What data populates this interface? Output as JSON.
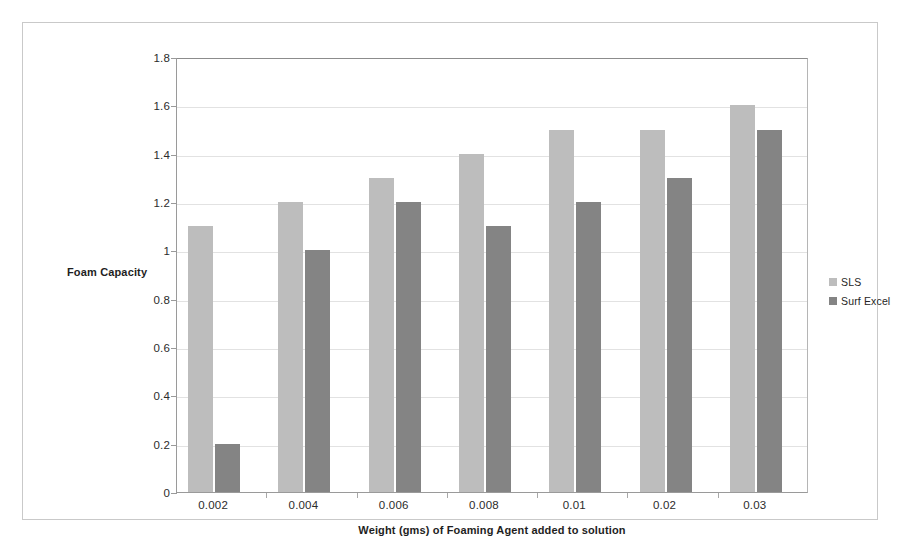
{
  "chart_data": {
    "type": "bar",
    "title": "",
    "subtitle": "",
    "xlabel": "Weight (gms) of Foaming Agent added to solution",
    "ylabel": "Foam Capacity",
    "categories": [
      "0.002",
      "0.004",
      "0.006",
      "0.008",
      "0.01",
      "0.02",
      "0.03"
    ],
    "series": [
      {
        "name": "SLS",
        "color": "#bdbdbd",
        "values": [
          1.1,
          1.2,
          1.3,
          1.4,
          1.5,
          1.5,
          1.6
        ]
      },
      {
        "name": "Surf Excel",
        "color": "#848484",
        "values": [
          0.2,
          1.0,
          1.2,
          1.1,
          1.2,
          1.3,
          1.5
        ]
      }
    ],
    "ylim": [
      0,
      1.8
    ],
    "yticks": [
      "0",
      "0.2",
      "0.4",
      "0.6",
      "0.8",
      "1",
      "1.2",
      "1.4",
      "1.6",
      "1.8"
    ],
    "ytick_values": [
      0,
      0.2,
      0.4,
      0.6,
      0.8,
      1,
      1.2,
      1.4,
      1.6,
      1.8
    ],
    "grid": true,
    "grid_color": "#e2e2e2",
    "legend_position": "right",
    "plot_background": "#ffffff"
  }
}
